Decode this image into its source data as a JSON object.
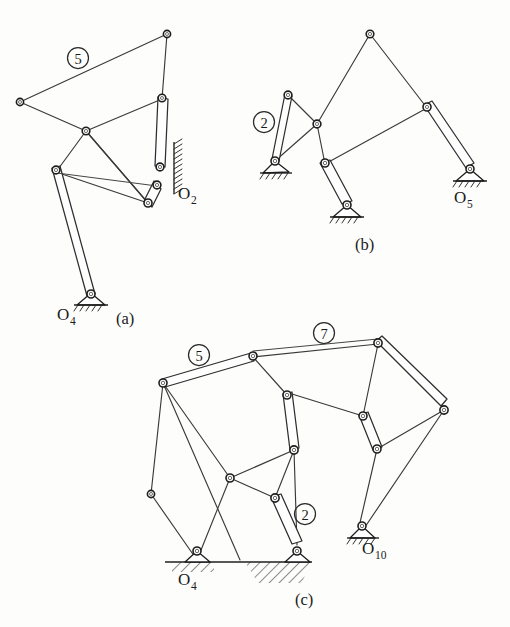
{
  "figure": {
    "type": "engineering-line-drawing",
    "background_color": "#fdfdfc",
    "line_color": "#2e2e2e",
    "subfigures": [
      {
        "id": "a",
        "caption": "(a)",
        "link_labels": [
          "5"
        ],
        "ground_labels": [
          "O",
          "O"
        ],
        "ground_label_full": [
          "O2",
          "O4"
        ],
        "ground_joints": 2,
        "description": "Six-bar linkage with quadrilateral coupler link 5, vertical wall ground at O2 and pinned ground at O4"
      },
      {
        "id": "b",
        "caption": "(b)",
        "link_labels": [
          "2"
        ],
        "ground_label_full": [
          "O5"
        ],
        "ground_joints": 3,
        "description": "Watt-type six-bar linkage with three ground pivots on horizontal supports"
      },
      {
        "id": "c",
        "caption": "(c)",
        "link_labels": [
          "5",
          "7",
          "2"
        ],
        "ground_label_full": [
          "O4",
          "O10"
        ],
        "ground_joints": 3,
        "description": "Ten-bar leg mechanism with ground line, hatched ground regions at O4 and slider region, and pinned ground at O10"
      }
    ],
    "labels": {
      "circle_5_a": "5",
      "circle_2_b": "2",
      "circle_5_c": "5",
      "circle_7_c": "7",
      "circle_2_c": "2",
      "O": "O",
      "sub_2": "2",
      "sub_4": "4",
      "sub_5": "5",
      "sub_10": "10",
      "caption_a": "(a)",
      "caption_b": "(b)",
      "caption_c": "(c)"
    }
  }
}
